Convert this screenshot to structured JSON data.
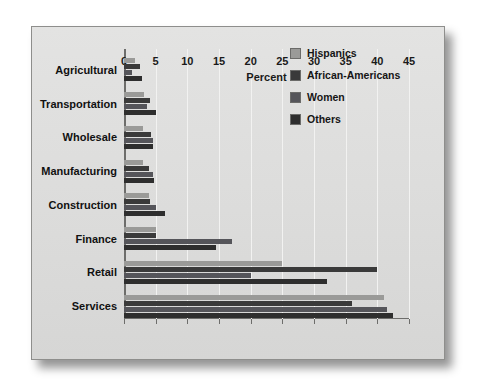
{
  "chart_data": {
    "type": "bar",
    "orientation": "horizontal",
    "title": "",
    "xlabel": "Percent",
    "ylabel": "",
    "xlim": [
      0,
      45
    ],
    "xticks": [
      0,
      5,
      10,
      15,
      20,
      25,
      30,
      35,
      40,
      45
    ],
    "grid": true,
    "legend_position": "top-right",
    "categories": [
      "Agricultural",
      "Transportation",
      "Wholesale",
      "Manufacturing",
      "Construction",
      "Finance",
      "Retail",
      "Services"
    ],
    "series": [
      {
        "name": "Hispanics",
        "color": "#9a9a98",
        "values": [
          1.8,
          3.2,
          3.0,
          3.0,
          4.0,
          5.0,
          25.0,
          41.0
        ]
      },
      {
        "name": "African-Americans",
        "color": "#3a3a3a",
        "values": [
          2.6,
          4.1,
          4.3,
          4.0,
          4.1,
          5.0,
          40.0,
          36.0
        ]
      },
      {
        "name": "Women",
        "color": "#55555a",
        "values": [
          1.2,
          3.6,
          4.5,
          4.6,
          5.0,
          17.0,
          20.0,
          41.5
        ]
      },
      {
        "name": "Others",
        "color": "#2e2e2e",
        "values": [
          2.8,
          5.0,
          4.6,
          4.8,
          6.5,
          14.5,
          32.0,
          42.5
        ]
      }
    ]
  },
  "legend": {
    "items": [
      {
        "label": "Hispanics",
        "color": "#9a9a98"
      },
      {
        "label": "African-Americans",
        "color": "#3a3a3a"
      },
      {
        "label": "Women",
        "color": "#55555a"
      },
      {
        "label": "Others",
        "color": "#2e2e2e"
      }
    ]
  },
  "axis": {
    "x_title": "Percent",
    "x_ticks": [
      "0",
      "5",
      "10",
      "15",
      "20",
      "25",
      "30",
      "35",
      "40",
      "45"
    ]
  }
}
